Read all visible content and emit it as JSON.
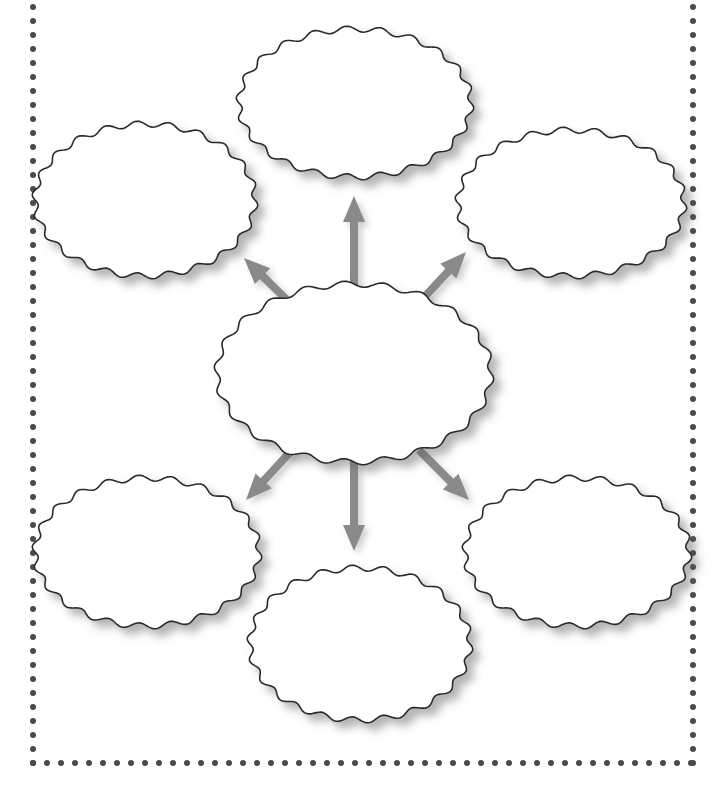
{
  "page": {
    "width": 721,
    "height": 793,
    "background_color": "#ffffff"
  },
  "frame": {
    "name": "dotted-border",
    "style": "dotted",
    "dot_color": "#4a4a50",
    "dot_diameter": 6,
    "dot_spacing": 14,
    "left": 33,
    "right": 693,
    "bottom": 763,
    "top": -8,
    "note": "top edge of the dotted frame is cropped above the visible area"
  },
  "shapes": {
    "outline_color": "#2b2b2b",
    "fill_color": "#ffffff",
    "shadow_color": "rgba(90,90,95,0.45)",
    "edge_style": "wavy-scalloped",
    "wave_count": 22,
    "wave_amplitude": 3,
    "stroke_width": 1.6
  },
  "arrows": {
    "color": "#8a8a8a",
    "shadow_color": "rgba(120,120,120,0.35)",
    "shaft_width": 8,
    "head_width": 22,
    "head_length": 26,
    "count": 6,
    "direction": "outward from center node"
  },
  "central_node": {
    "id": "center",
    "name": "center-oval",
    "label": "",
    "cx": 354,
    "cy": 373,
    "rx": 137,
    "ry": 89
  },
  "outer_nodes": [
    {
      "id": "top-left",
      "name": "oval-top-left",
      "label": "",
      "cx": 145,
      "cy": 200,
      "rx": 110,
      "ry": 76
    },
    {
      "id": "top-center",
      "name": "oval-top-center",
      "label": "",
      "cx": 355,
      "cy": 103,
      "rx": 116,
      "ry": 74
    },
    {
      "id": "top-right",
      "name": "oval-top-right",
      "label": "",
      "cx": 571,
      "cy": 203,
      "rx": 113,
      "ry": 73
    },
    {
      "id": "bottom-left",
      "name": "oval-bottom-left",
      "label": "",
      "cx": 147,
      "cy": 552,
      "rx": 112,
      "ry": 74
    },
    {
      "id": "bottom-center",
      "name": "oval-bottom-center",
      "label": "",
      "cx": 360,
      "cy": 644,
      "rx": 110,
      "ry": 76
    },
    {
      "id": "bottom-right",
      "name": "oval-bottom-right",
      "label": "",
      "cx": 577,
      "cy": 552,
      "rx": 112,
      "ry": 74
    }
  ],
  "connectors": [
    {
      "id": "arrow-up-left",
      "name": "arrow-center-to-top-left",
      "from": "center",
      "to": "top-left",
      "x1": 290,
      "y1": 303,
      "x2": 244,
      "y2": 258
    },
    {
      "id": "arrow-up",
      "name": "arrow-center-to-top-center",
      "from": "center",
      "to": "top-center",
      "x1": 354,
      "y1": 288,
      "x2": 354,
      "y2": 196
    },
    {
      "id": "arrow-up-right",
      "name": "arrow-center-to-top-right",
      "from": "center",
      "to": "top-right",
      "x1": 419,
      "y1": 303,
      "x2": 466,
      "y2": 252
    },
    {
      "id": "arrow-down-left",
      "name": "arrow-center-to-bottom-left",
      "from": "center",
      "to": "bottom-left",
      "x1": 292,
      "y1": 450,
      "x2": 246,
      "y2": 500
    },
    {
      "id": "arrow-down",
      "name": "arrow-center-to-bottom-center",
      "from": "center",
      "to": "bottom-center",
      "x1": 354,
      "y1": 460,
      "x2": 354,
      "y2": 551
    },
    {
      "id": "arrow-down-right",
      "name": "arrow-center-to-bottom-right",
      "from": "center",
      "to": "bottom-right",
      "x1": 419,
      "y1": 450,
      "x2": 469,
      "y2": 500
    }
  ]
}
